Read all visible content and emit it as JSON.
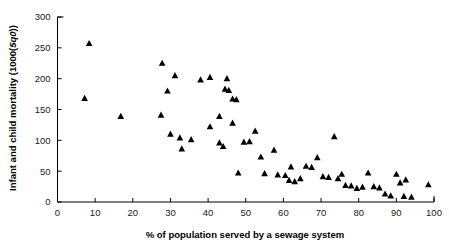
{
  "chart_data": {
    "type": "scatter",
    "title": "",
    "xlabel": "% of population served by a sewage system",
    "ylabel": "Infant and child mortality (1000(5q0))",
    "ylabel_parts": {
      "pre": "Infant and child mortality (1000(",
      "italic": "5q0",
      "post": "))"
    },
    "xlim": [
      0,
      100
    ],
    "ylim": [
      0,
      300
    ],
    "xticks": [
      0,
      10,
      20,
      30,
      40,
      50,
      60,
      70,
      80,
      90,
      100
    ],
    "yticks": [
      0,
      50,
      100,
      150,
      200,
      250,
      300
    ],
    "xtick_labels": [
      "0",
      "10",
      "20",
      "30",
      "40",
      "50",
      "60",
      "70",
      "80",
      "90",
      "100"
    ],
    "ytick_labels": [
      "0",
      "50",
      "100",
      "150",
      "200",
      "250",
      "300"
    ],
    "grid": false,
    "legend": null,
    "marker": "triangle-up",
    "marker_color": "#000000",
    "series": [
      {
        "name": "countries",
        "points": [
          [
            7.2,
            168
          ],
          [
            8.4,
            257
          ],
          [
            16.8,
            139
          ],
          [
            27.8,
            225
          ],
          [
            29.2,
            180
          ],
          [
            31.2,
            205
          ],
          [
            27.5,
            141
          ],
          [
            30.0,
            110
          ],
          [
            32.5,
            104
          ],
          [
            35.5,
            101
          ],
          [
            33.0,
            86
          ],
          [
            38.0,
            198
          ],
          [
            40.5,
            202
          ],
          [
            43.0,
            139
          ],
          [
            44.5,
            183
          ],
          [
            45.5,
            181
          ],
          [
            45.0,
            200
          ],
          [
            46.5,
            167
          ],
          [
            47.5,
            166
          ],
          [
            40.5,
            122
          ],
          [
            43.0,
            96
          ],
          [
            44.0,
            90
          ],
          [
            46.5,
            128
          ],
          [
            48.0,
            47
          ],
          [
            49.5,
            97
          ],
          [
            51.0,
            98
          ],
          [
            52.5,
            115
          ],
          [
            54.0,
            73
          ],
          [
            55.0,
            46
          ],
          [
            57.5,
            84
          ],
          [
            58.5,
            44
          ],
          [
            60.5,
            43
          ],
          [
            61.5,
            35
          ],
          [
            62.0,
            57
          ],
          [
            63.0,
            33
          ],
          [
            64.5,
            38
          ],
          [
            66.0,
            58
          ],
          [
            67.5,
            56
          ],
          [
            69.0,
            72
          ],
          [
            70.5,
            41
          ],
          [
            72.0,
            40
          ],
          [
            73.5,
            106
          ],
          [
            74.5,
            38
          ],
          [
            75.5,
            45
          ],
          [
            76.5,
            27
          ],
          [
            78.0,
            26
          ],
          [
            79.5,
            22
          ],
          [
            81.0,
            24
          ],
          [
            82.5,
            47
          ],
          [
            84.0,
            25
          ],
          [
            85.5,
            23
          ],
          [
            87.0,
            13
          ],
          [
            88.5,
            10
          ],
          [
            90.0,
            45
          ],
          [
            91.0,
            31
          ],
          [
            92.0,
            9
          ],
          [
            92.5,
            36
          ],
          [
            94.0,
            8
          ],
          [
            98.5,
            28
          ]
        ]
      }
    ]
  }
}
